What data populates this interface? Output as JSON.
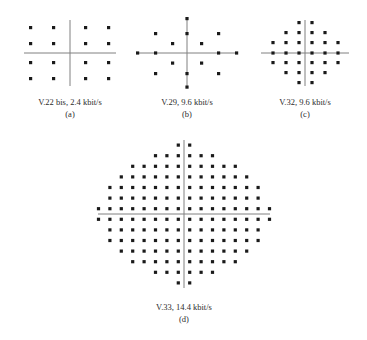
{
  "figure_title": "Signal constellation diagrams for ITU-T voiceband modems",
  "style": {
    "point_color": "#1a1a1a",
    "axis_color": "#808080",
    "background": "#ffffff"
  },
  "panels": [
    {
      "id": "a",
      "label": "(a)",
      "caption": "V.22 bis, 2.4 kbit/s",
      "standard": "V.22 bis",
      "bitrate": "2.4 kbit/s",
      "point_count": 16,
      "modulation": "16-QAM square lattice"
    },
    {
      "id": "b",
      "label": "(b)",
      "caption": "V.29, 9.6 kbit/s",
      "standard": "V.29",
      "bitrate": "9.6 kbit/s",
      "point_count": 16,
      "modulation": "16-point star / cross lattice"
    },
    {
      "id": "c",
      "label": "(c)",
      "caption": "V.32, 9.6 kbit/s",
      "standard": "V.32",
      "bitrate": "9.6 kbit/s",
      "point_count": 32,
      "modulation": "32-point cross lattice"
    },
    {
      "id": "d",
      "label": "(d)",
      "caption": "V.33, 14.4 kbit/s",
      "standard": "V.33",
      "bitrate": "14.4 kbit/s",
      "point_count": 128,
      "modulation": "128-point diamond lattice"
    }
  ],
  "chart_data": {
    "type": "scatter",
    "xlabel": "",
    "ylabel": "",
    "grid": false,
    "legend": "none",
    "panels": [
      {
        "id": "a",
        "title": "V.22 bis, 2.4 kbit/s",
        "axis_lines": {
          "x": true,
          "y": true
        },
        "xlim": [
          -4,
          4
        ],
        "ylim": [
          -4,
          4
        ],
        "points": [
          [
            -3,
            3
          ],
          [
            -1,
            3
          ],
          [
            1,
            3
          ],
          [
            3,
            3
          ],
          [
            -3,
            1
          ],
          [
            -1,
            1
          ],
          [
            1,
            1
          ],
          [
            3,
            1
          ],
          [
            -3,
            -1
          ],
          [
            -1,
            -1
          ],
          [
            1,
            -1
          ],
          [
            3,
            -1
          ],
          [
            -3,
            -3
          ],
          [
            -1,
            -3
          ],
          [
            1,
            -3
          ],
          [
            3,
            -3
          ]
        ]
      },
      {
        "id": "b",
        "title": "V.29, 9.6 kbit/s",
        "axis_lines": {
          "x": true,
          "y": true
        },
        "xlim": [
          -5,
          5
        ],
        "ylim": [
          -5,
          5
        ],
        "points": [
          [
            0,
            5
          ],
          [
            0,
            3
          ],
          [
            0,
            -3
          ],
          [
            0,
            -5
          ],
          [
            5,
            0
          ],
          [
            3,
            0
          ],
          [
            -3,
            0
          ],
          [
            -5,
            0
          ],
          [
            3,
            3
          ],
          [
            -3,
            3
          ],
          [
            3,
            -3
          ],
          [
            -3,
            -3
          ],
          [
            1.5,
            1.5
          ],
          [
            -1.5,
            1.5
          ],
          [
            1.5,
            -1.5
          ],
          [
            -1.5,
            -1.5
          ]
        ]
      },
      {
        "id": "c",
        "title": "V.32, 9.6 kbit/s",
        "axis_lines": {
          "x": true,
          "y": true
        },
        "xlim": [
          -6,
          6
        ],
        "ylim": [
          -6,
          6
        ],
        "points": [
          [
            -1,
            5
          ],
          [
            1,
            5
          ],
          [
            -3,
            3
          ],
          [
            -1,
            3
          ],
          [
            1,
            3
          ],
          [
            3,
            3
          ],
          [
            -5,
            1
          ],
          [
            -3,
            1
          ],
          [
            -1,
            1
          ],
          [
            1,
            1
          ],
          [
            3,
            1
          ],
          [
            5,
            1
          ],
          [
            -5,
            -1
          ],
          [
            -3,
            -1
          ],
          [
            -1,
            -1
          ],
          [
            1,
            -1
          ],
          [
            3,
            -1
          ],
          [
            5,
            -1
          ],
          [
            -3,
            -3
          ],
          [
            -1,
            -3
          ],
          [
            1,
            -3
          ],
          [
            3,
            -3
          ],
          [
            -1,
            -5
          ],
          [
            1,
            -5
          ],
          [
            -3,
            5
          ],
          [
            3,
            5
          ],
          [
            -5,
            3
          ],
          [
            5,
            3
          ],
          [
            -5,
            -3
          ],
          [
            5,
            -3
          ],
          [
            -3,
            -5
          ],
          [
            3,
            -5
          ]
        ]
      },
      {
        "id": "d",
        "title": "V.33, 14.4 kbit/s",
        "axis_lines": {
          "x": true,
          "y": true
        },
        "xlim": [
          -13,
          13
        ],
        "ylim": [
          -13,
          13
        ],
        "lattice": "odd-integer square lattice truncated to a diamond, 128 points",
        "row_counts": [
          2,
          6,
          10,
          12,
          14,
          14,
          16,
          16,
          14,
          14,
          12,
          10,
          6,
          2
        ]
      }
    ]
  }
}
